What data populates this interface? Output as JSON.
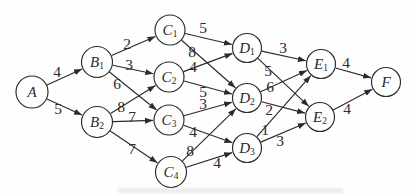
{
  "diagram": {
    "type": "weighted-directed-layered-graph",
    "background": "#fefefe",
    "ink": "#2b2b2b",
    "node_fill": "#fefefe",
    "node_font_size": 15,
    "sub_font_size": 9.5,
    "weight_font_size": 15.5,
    "nodes": [
      {
        "id": "A",
        "base": "A",
        "sub": "",
        "x": 32,
        "y": 92,
        "r": 16
      },
      {
        "id": "B1",
        "base": "B",
        "sub": "1",
        "x": 97,
        "y": 62,
        "r": 15.5
      },
      {
        "id": "B2",
        "base": "B",
        "sub": "2",
        "x": 97,
        "y": 122,
        "r": 15.5
      },
      {
        "id": "C1",
        "base": "C",
        "sub": "1",
        "x": 170,
        "y": 30,
        "r": 15
      },
      {
        "id": "C2",
        "base": "C",
        "sub": "2",
        "x": 169,
        "y": 77,
        "r": 15
      },
      {
        "id": "C3",
        "base": "C",
        "sub": "3",
        "x": 169,
        "y": 120,
        "r": 15
      },
      {
        "id": "C4",
        "base": "C",
        "sub": "4",
        "x": 171,
        "y": 172,
        "r": 15.5
      },
      {
        "id": "D1",
        "base": "D",
        "sub": "1",
        "x": 247,
        "y": 48,
        "r": 14.5
      },
      {
        "id": "D2",
        "base": "D",
        "sub": "2",
        "x": 247,
        "y": 98,
        "r": 14.5
      },
      {
        "id": "D3",
        "base": "D",
        "sub": "3",
        "x": 247,
        "y": 148,
        "r": 14.5
      },
      {
        "id": "E1",
        "base": "E",
        "sub": "1",
        "x": 321,
        "y": 64,
        "r": 14.5
      },
      {
        "id": "E2",
        "base": "E",
        "sub": "2",
        "x": 320,
        "y": 117,
        "r": 14.5
      },
      {
        "id": "F",
        "base": "F",
        "sub": "",
        "x": 386,
        "y": 82,
        "r": 14.5
      }
    ],
    "edges": [
      {
        "from": "A",
        "to": "B1",
        "weight": "4",
        "lx": 57,
        "ly": 71
      },
      {
        "from": "A",
        "to": "B2",
        "weight": "5",
        "lx": 58,
        "ly": 108
      },
      {
        "from": "B1",
        "to": "C1",
        "weight": "2",
        "lx": 127,
        "ly": 43
      },
      {
        "from": "B1",
        "to": "C2",
        "weight": "3",
        "lx": 129,
        "ly": 64
      },
      {
        "from": "B1",
        "to": "C3",
        "weight": "6",
        "lx": 117,
        "ly": 83
      },
      {
        "from": "B2",
        "to": "C2",
        "weight": "8",
        "lx": 121,
        "ly": 106
      },
      {
        "from": "B2",
        "to": "C3",
        "weight": "7",
        "lx": 132,
        "ly": 116
      },
      {
        "from": "B2",
        "to": "C4",
        "weight": "7",
        "lx": 132,
        "ly": 148
      },
      {
        "from": "C1",
        "to": "D1",
        "weight": "5",
        "lx": 203,
        "ly": 27
      },
      {
        "from": "C1",
        "to": "D2",
        "weight": "8",
        "lx": 192,
        "ly": 51
      },
      {
        "from": "C2",
        "to": "D1",
        "weight": "4",
        "lx": 193,
        "ly": 66
      },
      {
        "from": "C2",
        "to": "D2",
        "weight": "5",
        "lx": 203,
        "ly": 91
      },
      {
        "from": "C3",
        "to": "D2",
        "weight": "3",
        "lx": 203,
        "ly": 103
      },
      {
        "from": "C3",
        "to": "D3",
        "weight": "4",
        "lx": 193,
        "ly": 131
      },
      {
        "from": "C4",
        "to": "D2",
        "weight": "8",
        "lx": 190,
        "ly": 150
      },
      {
        "from": "C4",
        "to": "D3",
        "weight": "4",
        "lx": 217,
        "ly": 162
      },
      {
        "from": "D1",
        "to": "E1",
        "weight": "3",
        "lx": 283,
        "ly": 47
      },
      {
        "from": "D1",
        "to": "E2",
        "weight": "5",
        "lx": 268,
        "ly": 70
      },
      {
        "from": "D2",
        "to": "E1",
        "weight": "6",
        "lx": 270,
        "ly": 86
      },
      {
        "from": "D2",
        "to": "E2",
        "weight": "2",
        "lx": 269,
        "ly": 109
      },
      {
        "from": "D3",
        "to": "E1",
        "weight": "1",
        "lx": 265,
        "ly": 129
      },
      {
        "from": "D3",
        "to": "E2",
        "weight": "3",
        "lx": 280,
        "ly": 140
      },
      {
        "from": "E1",
        "to": "F",
        "weight": "4",
        "lx": 346,
        "ly": 62
      },
      {
        "from": "E2",
        "to": "F",
        "weight": "4",
        "lx": 347,
        "ly": 108
      }
    ],
    "artifact": {
      "x": 118,
      "y": 188,
      "width": 225,
      "height": 5,
      "color": "#c9c9c4",
      "opacity": 0.35
    }
  }
}
